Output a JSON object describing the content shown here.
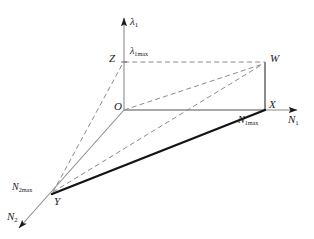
{
  "figure": {
    "kind": "3d-axis-diagram",
    "width": 314,
    "height": 239,
    "background": "#ffffff",
    "stroke_light": "#8c8c8c",
    "stroke_dark": "#1a1a1a",
    "dash_color": "#8c8c8c"
  },
  "axes": [
    {
      "key": "lambda1",
      "label": "λ",
      "sub": "1",
      "direction": "up",
      "tip": [
        124,
        14
      ]
    },
    {
      "key": "n1",
      "label": "N",
      "sub": "1",
      "direction": "right",
      "tip": [
        303,
        110
      ]
    },
    {
      "key": "n2",
      "label": "N",
      "sub": "2",
      "direction": "down-left",
      "tip": [
        13,
        232
      ]
    }
  ],
  "points": [
    {
      "key": "O",
      "label": "O",
      "sub": "",
      "x": 124,
      "y": 110
    },
    {
      "key": "Z",
      "label": "Z",
      "sub": "",
      "x": 124,
      "y": 62
    },
    {
      "key": "W",
      "label": "W",
      "sub": "",
      "x": 265,
      "y": 62
    },
    {
      "key": "X",
      "label": "X",
      "sub": "",
      "x": 265,
      "y": 110
    },
    {
      "key": "Y",
      "label": "Y",
      "sub": "",
      "x": 52,
      "y": 194
    }
  ],
  "value_labels": [
    {
      "key": "lambda1max",
      "label": "λ",
      "sub": "1max",
      "anchor": "Z"
    },
    {
      "key": "n1max",
      "label": "N",
      "sub": "1max",
      "anchor": "X"
    },
    {
      "key": "n2max",
      "label": "N",
      "sub": "2max",
      "anchor": "Y"
    }
  ],
  "edges": [
    {
      "key": "O-X",
      "from": "O",
      "to": "X",
      "style": "solid",
      "weight": "thin"
    },
    {
      "key": "X-W",
      "from": "X",
      "to": "W",
      "style": "solid",
      "weight": "thin"
    },
    {
      "key": "O-Z",
      "from": "O",
      "to": "Z",
      "style": "solid",
      "weight": "thin"
    },
    {
      "key": "Z-W",
      "from": "Z",
      "to": "W",
      "style": "dashed",
      "weight": "thin"
    },
    {
      "key": "O-W",
      "from": "O",
      "to": "W",
      "style": "dashed",
      "weight": "thin"
    },
    {
      "key": "Y-W",
      "from": "Y",
      "to": "W",
      "style": "dashed",
      "weight": "thin"
    },
    {
      "key": "Y-Z",
      "from": "Y",
      "to": "Z",
      "style": "dashed",
      "weight": "thin"
    },
    {
      "key": "Y-X",
      "from": "Y",
      "to": "X",
      "style": "solid",
      "weight": "thick"
    }
  ]
}
